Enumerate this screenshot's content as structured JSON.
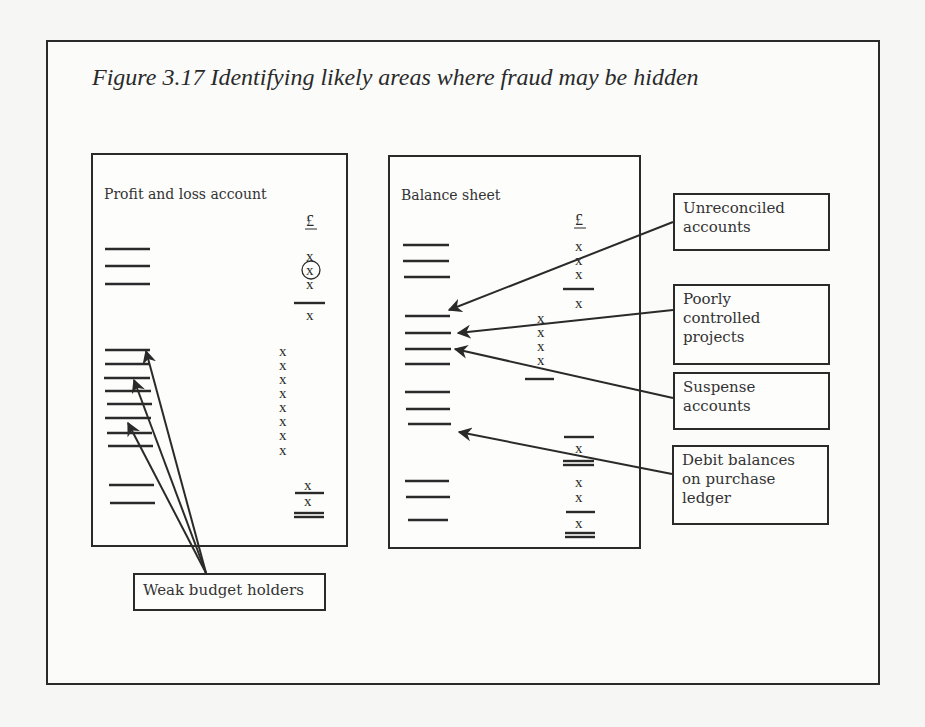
{
  "figure": {
    "title": "Figure 3.17  Identifying likely areas where fraud may be hidden"
  },
  "panels": {
    "profit_loss": {
      "title": "Profit and loss account",
      "currency_symbol": "£"
    },
    "balance_sheet": {
      "title": "Balance sheet",
      "currency_symbol": "£"
    }
  },
  "labels": {
    "unreconciled": [
      "Unreconciled",
      "accounts"
    ],
    "poorly_controlled": [
      "Poorly",
      "controlled",
      "projects"
    ],
    "suspense": [
      "Suspense",
      "accounts"
    ],
    "debit_balances": [
      "Debit balances",
      "on purchase",
      "ledger"
    ],
    "weak_budget": [
      "Weak budget holders"
    ]
  },
  "marks": {
    "x": "x",
    "circled_x": "x"
  },
  "colors": {
    "ink": "#2a2a2a",
    "paper": "#f6f6f4"
  }
}
